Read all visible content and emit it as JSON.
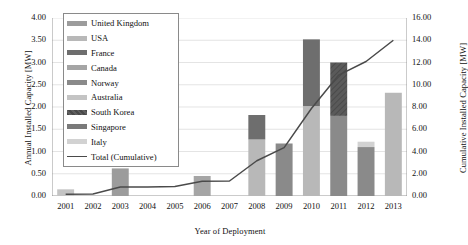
{
  "chart_data": {
    "type": "bar",
    "title": "",
    "subtitle": "",
    "xlabel": "Year of Deployment",
    "ylabel": "Annual Installed Capacity [MW]",
    "y2label": "Cumulative Installed Capacity [MW]",
    "categories": [
      "2001",
      "2002",
      "2003",
      "2004",
      "2005",
      "2006",
      "2007",
      "2008",
      "2009",
      "2010",
      "2011",
      "2012",
      "2013"
    ],
    "ylim": [
      0,
      4
    ],
    "ytick_labels": [
      "0.00",
      "0.50",
      "1.00",
      "1.50",
      "2.00",
      "2.50",
      "3.00",
      "3.50",
      "4.00"
    ],
    "ytick_values": [
      0,
      0.5,
      1,
      1.5,
      2,
      2.5,
      3,
      3.5,
      4
    ],
    "y2lim": [
      0,
      16
    ],
    "y2tick_labels": [
      "0.00",
      "2.00",
      "4.00",
      "6.00",
      "8.00",
      "10.00",
      "12.00",
      "14.00",
      "16.00"
    ],
    "y2tick_values": [
      0,
      2,
      4,
      6,
      8,
      10,
      12,
      14,
      16
    ],
    "grid": true,
    "stacked": true,
    "legend_position": "upper-left-inside",
    "series": [
      {
        "name": "United Kingdom",
        "color": "#9c9c9c",
        "pattern": "solid",
        "values": [
          0.0,
          0.0,
          0.62,
          0.0,
          0.0,
          0.0,
          0.0,
          0.0,
          0.0,
          0.0,
          0.0,
          0.0,
          0.0
        ]
      },
      {
        "name": "USA",
        "color": "#b8b8b8",
        "pattern": "solid",
        "values": [
          0.0,
          0.0,
          0.0,
          0.0,
          0.0,
          0.0,
          0.0,
          1.27,
          0.0,
          2.02,
          0.0,
          0.0,
          2.32
        ]
      },
      {
        "name": "France",
        "color": "#6e6e6e",
        "pattern": "solid",
        "values": [
          0.0,
          0.0,
          0.0,
          0.0,
          0.0,
          0.0,
          0.0,
          0.55,
          0.0,
          1.5,
          0.0,
          0.0,
          0.0
        ]
      },
      {
        "name": "Canada",
        "color": "#a5a5a5",
        "pattern": "solid",
        "values": [
          0.0,
          0.0,
          0.0,
          0.0,
          0.0,
          0.45,
          0.0,
          0.0,
          0.0,
          0.0,
          0.0,
          0.0,
          0.0
        ]
      },
      {
        "name": "Norway",
        "color": "#8a8a8a",
        "pattern": "solid",
        "values": [
          0.0,
          0.0,
          0.0,
          0.0,
          0.0,
          0.0,
          0.0,
          0.0,
          1.18,
          0.0,
          1.8,
          1.1,
          0.0
        ]
      },
      {
        "name": "Australia",
        "color": "#c4c4c4",
        "pattern": "solid",
        "values": [
          0.15,
          0.0,
          0.0,
          0.0,
          0.0,
          0.0,
          0.0,
          0.0,
          0.0,
          0.0,
          0.0,
          0.0,
          0.0
        ]
      },
      {
        "name": "South Korea",
        "color": "#555555",
        "pattern": "hatched",
        "values": [
          0.0,
          0.0,
          0.0,
          0.0,
          0.0,
          0.0,
          0.0,
          0.0,
          0.0,
          0.0,
          1.2,
          0.0,
          0.0
        ]
      },
      {
        "name": "Singapore",
        "color": "#7a7a7a",
        "pattern": "solid",
        "values": [
          0.0,
          0.0,
          0.0,
          0.0,
          0.0,
          0.0,
          0.0,
          0.0,
          0.0,
          0.0,
          0.0,
          0.0,
          0.0
        ]
      },
      {
        "name": "Italy",
        "color": "#d2d2d2",
        "pattern": "solid",
        "values": [
          0.0,
          0.0,
          0.0,
          0.0,
          0.0,
          0.0,
          0.0,
          0.0,
          0.0,
          0.0,
          0.0,
          0.12,
          0.0
        ]
      }
    ],
    "line_series": {
      "name": "Total (Cumulative)",
      "color": "#4a4a4a",
      "axis": "right",
      "values": [
        0.15,
        0.18,
        0.8,
        0.82,
        0.85,
        1.32,
        1.35,
        3.17,
        4.35,
        7.87,
        10.87,
        12.09,
        14.0
      ]
    },
    "annual_totals": [
      0.15,
      0.0,
      0.62,
      0.0,
      0.0,
      0.45,
      0.0,
      1.82,
      1.18,
      3.52,
      3.0,
      1.22,
      2.32
    ]
  },
  "legend": {
    "items": [
      {
        "label": "United Kingdom",
        "type": "swatch"
      },
      {
        "label": "USA",
        "type": "swatch"
      },
      {
        "label": "France",
        "type": "swatch"
      },
      {
        "label": "Canada",
        "type": "swatch"
      },
      {
        "label": "Norway",
        "type": "swatch"
      },
      {
        "label": "Australia",
        "type": "swatch"
      },
      {
        "label": "South Korea",
        "type": "swatch"
      },
      {
        "label": "Singapore",
        "type": "swatch"
      },
      {
        "label": "Italy",
        "type": "swatch"
      },
      {
        "label": "Total (Cumulative)",
        "type": "line"
      }
    ]
  },
  "colors": {
    "grid": "#d9d9d9",
    "axis": "#8a8a8a",
    "text": "#111111",
    "line": "#4a4a4a",
    "background": "#ffffff"
  }
}
